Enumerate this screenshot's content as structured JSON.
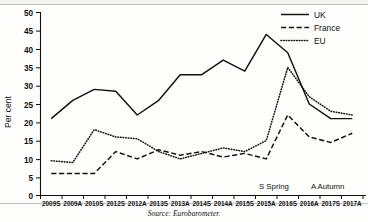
{
  "chart_data": {
    "type": "line",
    "title": "",
    "xlabel": "",
    "ylabel": "Per cent",
    "ylim": [
      0,
      50
    ],
    "yticks": [
      0,
      5,
      10,
      15,
      20,
      25,
      30,
      35,
      40,
      45,
      50
    ],
    "grid": false,
    "legend_position": "top-right",
    "categories": [
      "2009S",
      "2009A",
      "2010S",
      "2012S",
      "2012A",
      "2013S",
      "2013A",
      "2014S",
      "2014A",
      "2015S",
      "2015A",
      "2016S",
      "2016A",
      "2017S",
      "2017A"
    ],
    "series": [
      {
        "name": "UK",
        "style": "solid",
        "values": [
          21,
          26,
          29,
          28.5,
          22,
          26,
          33,
          33,
          37,
          34,
          44,
          39,
          25,
          21,
          21
        ]
      },
      {
        "name": "France",
        "style": "dashed",
        "values": [
          6,
          6,
          6,
          12,
          10,
          12.5,
          11,
          12,
          10.5,
          11.5,
          10,
          22,
          16,
          14.5,
          17
        ]
      },
      {
        "name": "EU",
        "style": "dotted",
        "values": [
          9.5,
          9,
          18,
          16,
          15.5,
          12,
          10,
          11.5,
          13,
          12,
          15,
          35,
          27,
          23,
          22
        ]
      }
    ],
    "source": "Source: Eurobarometer."
  },
  "axis": {
    "y_title": "Per cent",
    "y_tick_labels": [
      "50",
      "45",
      "40",
      "35",
      "30",
      "25",
      "20",
      "15",
      "10",
      "5",
      "0"
    ],
    "x_tick_labels": [
      "2009S",
      "2009A",
      "2010S",
      "2012S",
      "2012A",
      "2013S",
      "2013A",
      "2014S",
      "2014A",
      "2015S",
      "2015A",
      "2016S",
      "2016A",
      "2017S",
      "2017A"
    ]
  },
  "legend": {
    "items": [
      {
        "label": "UK",
        "style": "solid"
      },
      {
        "label": "France",
        "style": "dashed"
      },
      {
        "label": "EU",
        "style": "dotted"
      }
    ]
  },
  "notes": {
    "season_key_spring": "S  Spring",
    "season_key_autumn": "A  Autumn"
  },
  "footer": {
    "source": "Source: Eurobarometer."
  }
}
